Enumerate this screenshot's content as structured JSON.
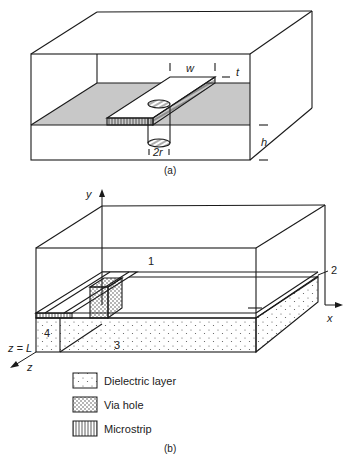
{
  "figure_a": {
    "caption": "(a)",
    "dimensions": {
      "strip_width": "w",
      "strip_thickness": "t",
      "substrate_height": "h",
      "via_diameter": "2r"
    }
  },
  "figure_b": {
    "caption": "(b)",
    "axes": {
      "x": "x",
      "y": "y",
      "z": "z",
      "z_end": "z = L"
    },
    "regions": [
      "1",
      "2",
      "3",
      "4"
    ],
    "legend": [
      {
        "label": "Dielectric layer",
        "pattern": "sparse-dots"
      },
      {
        "label": "Via hole",
        "pattern": "dense-dots"
      },
      {
        "label": "Microstrip",
        "pattern": "vertical-hatch"
      }
    ]
  },
  "colors": {
    "line": "#1a1a1a",
    "ground_plane_fill": "#c8c8c8",
    "background": "#ffffff"
  }
}
